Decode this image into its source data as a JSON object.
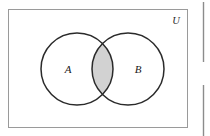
{
  "figure": {
    "kind": "venn-diagram",
    "caption_text": "",
    "universe": {
      "label": "U",
      "border_color": "#9a9a9a",
      "fill_color": "#ffffff",
      "x": 8,
      "y": 9,
      "width": 180,
      "height": 119,
      "label_x": 176,
      "label_y": 24
    },
    "sets": [
      {
        "label": "A",
        "cx": 77,
        "cy": 69,
        "r": 36,
        "stroke_color": "#2a2a2a",
        "fill_color": "#ffffff",
        "label_x": 68,
        "label_y": 73
      },
      {
        "label": "B",
        "cx": 128,
        "cy": 69,
        "r": 36,
        "stroke_color": "#2a2a2a",
        "fill_color": "#ffffff",
        "label_x": 138,
        "label_y": 73
      }
    ],
    "shaded_region": {
      "name": "A-intersect-B",
      "fill_color": "#d2d2d2",
      "stroke_color": "#2a2a2a"
    }
  },
  "page_artifacts": {
    "rule_color": "#8c8c8c",
    "rules": [
      {
        "name": "neighbor-rule-top",
        "x": 203,
        "y": 2,
        "height": 60
      },
      {
        "name": "neighbor-rule-bottom",
        "x": 203,
        "y": 85,
        "height": 51
      }
    ]
  }
}
